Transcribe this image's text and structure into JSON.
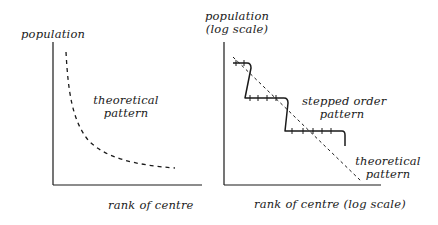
{
  "left_panel": {
    "y_axis_label": "population",
    "x_axis_label": "rank of centre",
    "curve_label_line1": "theoretical",
    "curve_label_line2": "pattern"
  },
  "right_panel": {
    "y_axis_label_line1": "population",
    "y_axis_label_line2": "(log scale)",
    "x_axis_label": "rank of centre (log scale)",
    "stepped_label_line1": "stepped order",
    "stepped_label_line2": "pattern",
    "theoretical_label_line1": "theoretical",
    "theoretical_label_line2": "pattern"
  },
  "colors": {
    "ink": "#1a1a1a",
    "background": "#ffffff"
  }
}
